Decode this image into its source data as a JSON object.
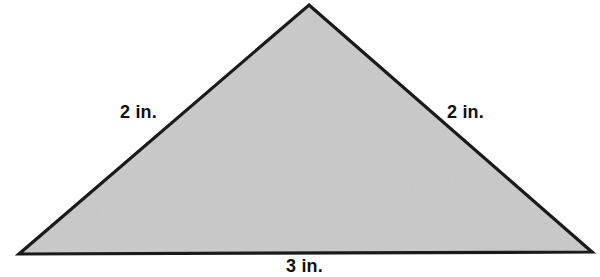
{
  "figure": {
    "name": "isosceles-triangle-with-side-lengths",
    "background_color": "#ffffff",
    "shape": {
      "type": "triangle",
      "fill_color": "#c9c9c9",
      "stroke_color": "#1a1a1a",
      "stroke_width": 3,
      "vertices": {
        "apex": {
          "x": 309,
          "y": 5
        },
        "bottom_left": {
          "x": 19,
          "y": 254
        },
        "bottom_right": {
          "x": 592,
          "y": 252
        }
      }
    },
    "labels": {
      "left_side": "2 in.",
      "right_side": "2 in.",
      "base_side": "3 in."
    },
    "measurements": {
      "unit": "in.",
      "left_side_length": 2,
      "right_side_length": 2,
      "base_length": 3
    }
  }
}
